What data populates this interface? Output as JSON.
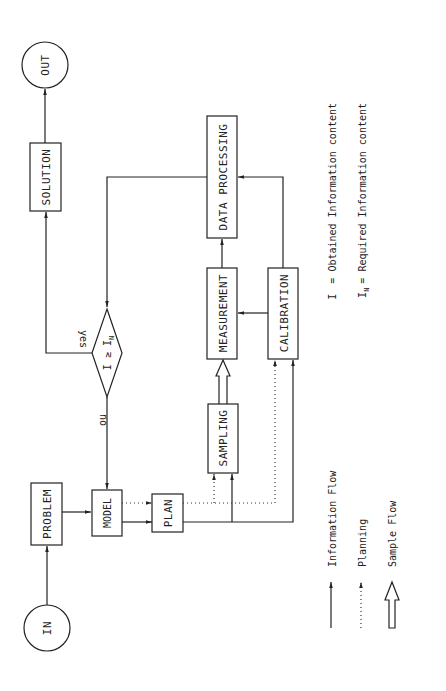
{
  "nodes": {
    "in": "IN",
    "out": "OUT",
    "problem": "PROBLEM",
    "model": "MODEL",
    "plan": "PLAN",
    "sampling": "SAMPLING",
    "measurement": "MEASUREMENT",
    "calibration": "CALIBRATION",
    "data_processing": "DATA PROCESSING",
    "solution": "SOLUTION",
    "decision": "I ≥ I",
    "decision_sub": "N"
  },
  "edge_labels": {
    "yes": "yes",
    "no": "no"
  },
  "legend": {
    "definitions": [
      {
        "symbol": "I",
        "sub": "",
        "text": "= Obtained Information content"
      },
      {
        "symbol": "I",
        "sub": "N",
        "text": "= Required Information content"
      }
    ],
    "line_types": [
      {
        "type": "solid-arrow",
        "label": "Information Flow"
      },
      {
        "type": "dotted-arrow",
        "label": "Planning"
      },
      {
        "type": "hollow-arrow",
        "label": "Sample Flow"
      }
    ]
  },
  "colors": {
    "line": "#222222",
    "background": "#ffffff"
  }
}
